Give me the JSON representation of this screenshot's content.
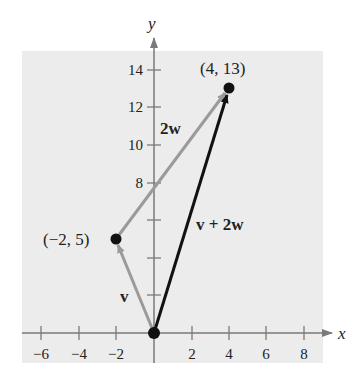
{
  "diagram": {
    "title": "",
    "background_color": "#ececec",
    "axis_color": "#7a7a7a",
    "gray_vector_color": "#9a9a9a",
    "result_vector_color": "#111111",
    "axes": {
      "x_label": "x",
      "y_label": "y",
      "x_ticks": [
        "−6",
        "−4",
        "−2",
        "2",
        "4",
        "6",
        "8"
      ],
      "y_ticks": [
        "14",
        "12",
        "10",
        "8"
      ]
    },
    "points": [
      {
        "label": "(−2, 5)",
        "x": -2,
        "y": 5
      },
      {
        "label": "(4, 13)",
        "x": 4,
        "y": 13
      },
      {
        "label": "",
        "x": 0,
        "y": 0
      }
    ],
    "vectors": [
      {
        "label": "v",
        "from": [
          0,
          0
        ],
        "to": [
          -2,
          5
        ]
      },
      {
        "label": "2w",
        "from": [
          -2,
          5
        ],
        "to": [
          4,
          13
        ]
      },
      {
        "label": "v + 2w",
        "from": [
          0,
          0
        ],
        "to": [
          4,
          13
        ]
      }
    ]
  }
}
